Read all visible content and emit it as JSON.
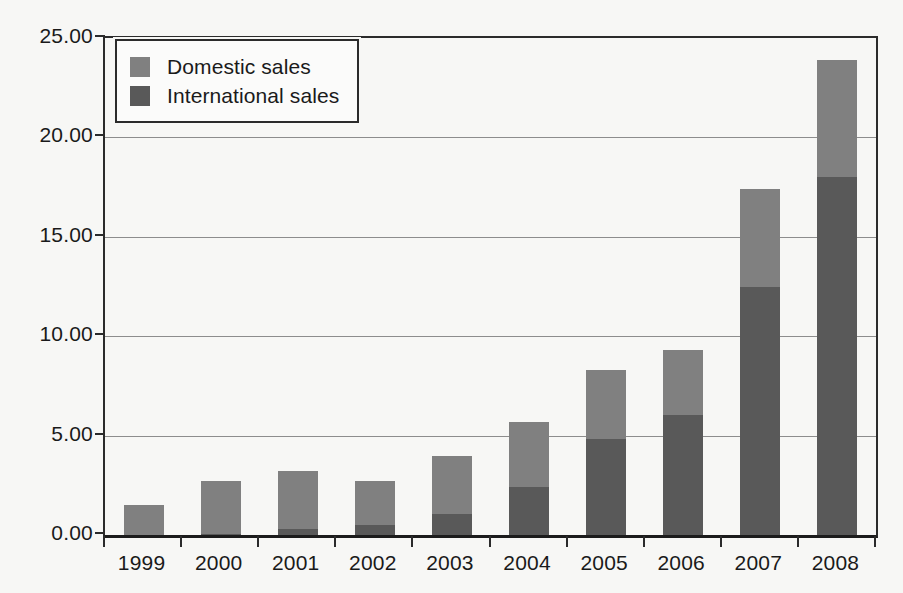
{
  "chart_data": {
    "type": "bar",
    "subtype": "stacked-column",
    "title": "",
    "xlabel": "",
    "ylabel": "",
    "categories": [
      "1999",
      "2000",
      "2001",
      "2002",
      "2003",
      "2004",
      "2005",
      "2006",
      "2007",
      "2008"
    ],
    "series": [
      {
        "name": "International sales",
        "color": "#595959",
        "values": [
          0.0,
          0.05,
          0.3,
          0.5,
          1.05,
          2.4,
          4.85,
          6.05,
          12.5,
          18.0
        ]
      },
      {
        "name": "Domestic sales",
        "color": "#808080",
        "values": [
          1.5,
          2.65,
          2.9,
          2.2,
          2.95,
          3.3,
          3.45,
          3.25,
          4.9,
          5.9
        ]
      }
    ],
    "totals": [
      1.5,
      2.7,
      3.2,
      2.7,
      4.0,
      5.7,
      8.3,
      9.3,
      17.4,
      23.9
    ],
    "ylim": [
      0,
      25
    ],
    "ytick_values": [
      0,
      5,
      10,
      15,
      20,
      25
    ],
    "ytick_labels": [
      "0.00",
      "5.00",
      "10.00",
      "15.00",
      "20.00",
      "25.00"
    ],
    "grid": true,
    "grid_axis": "y",
    "legend_position": "top-left",
    "legend_order": [
      "Domestic sales",
      "International sales"
    ]
  },
  "legend": {
    "items": [
      {
        "label": "Domestic sales",
        "color": "#808080"
      },
      {
        "label": "International sales",
        "color": "#595959"
      }
    ]
  },
  "colors": {
    "domestic": "#808080",
    "international": "#595959",
    "axis": "#2b2b2b",
    "grid": "#8d8d8d",
    "background": "#f7f7f5",
    "text": "#1a1a1a"
  }
}
